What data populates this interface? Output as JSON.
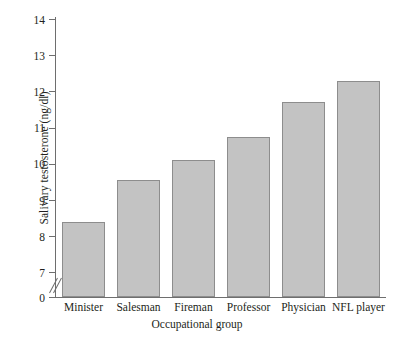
{
  "chart_data": {
    "type": "bar",
    "title": "",
    "subtitle": "",
    "xlabel": "Occupational group",
    "ylabel": "Salivary testosterone (ng/dl)",
    "categories": [
      "Minister",
      "Salesman",
      "Fireman",
      "Professor",
      "Physician",
      "NFL player"
    ],
    "values": [
      8.4,
      9.55,
      10.1,
      10.75,
      11.7,
      12.3
    ],
    "ylim": [
      0,
      14
    ],
    "yticks": [
      0,
      7,
      8,
      9,
      10,
      11,
      12,
      13,
      14
    ],
    "ytick_labels": [
      "0",
      "7",
      "8",
      "9",
      "10",
      "11",
      "12",
      "13",
      "14"
    ],
    "y_axis_break": true,
    "y_axis_break_after": 0,
    "grid": false,
    "legend": null,
    "bar_fill_color": "#c3c3c3",
    "bar_border_color": "#8d8d8d",
    "axis_color": "#6e6e6e",
    "text_color": "#231f20",
    "background_color": "#ffffff"
  }
}
